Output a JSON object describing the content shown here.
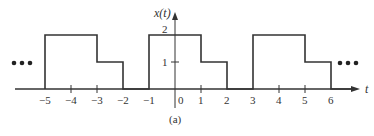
{
  "figure": {
    "y_axis_label": "x(t)",
    "x_axis_label": "t",
    "caption": "(a)",
    "ellipsis": "•••",
    "y_tick_labels": [
      "1",
      "2"
    ],
    "x_tick_labels": [
      "−5",
      "−4",
      "−3",
      "−2",
      "−1",
      "0",
      "1",
      "2",
      "3",
      "4",
      "5",
      "6"
    ],
    "line_color": "#333333"
  },
  "signal": {
    "description": "Periodic piecewise-constant signal x(t) with period 4",
    "segments": [
      {
        "t_start": -5,
        "t_end": -3,
        "value": 2
      },
      {
        "t_start": -3,
        "t_end": -2,
        "value": 1
      },
      {
        "t_start": -2,
        "t_end": -1,
        "value": 0
      },
      {
        "t_start": -1,
        "t_end": 1,
        "value": 2
      },
      {
        "t_start": 1,
        "t_end": 2,
        "value": 1
      },
      {
        "t_start": 2,
        "t_end": 3,
        "value": 0
      },
      {
        "t_start": 3,
        "t_end": 5,
        "value": 2
      },
      {
        "t_start": 5,
        "t_end": 6,
        "value": 1
      }
    ],
    "period": 4
  }
}
